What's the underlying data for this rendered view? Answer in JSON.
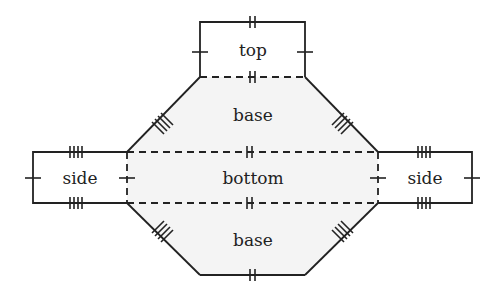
{
  "diagram": {
    "type": "net of a solid (hexagonal prism / octagonal cross-section net)",
    "faces": {
      "top": "top",
      "base_upper": "base",
      "bottom": "bottom",
      "base_lower": "base",
      "side_left": "side",
      "side_right": "side"
    },
    "colors": {
      "line": "#222222",
      "fill_base": "#f3f3f3",
      "background": "#ffffff"
    },
    "edge_marks": {
      "top_box_top": 2,
      "top_box_left": 1,
      "top_box_right": 1,
      "top_fold": 2,
      "diagonals": 4,
      "side_horizontal": 4,
      "side_outer": 1,
      "side_fold": 1,
      "bottom_fold_upper": 2,
      "bottom_fold_lower": 2,
      "base_lower_bottom": 2
    }
  }
}
